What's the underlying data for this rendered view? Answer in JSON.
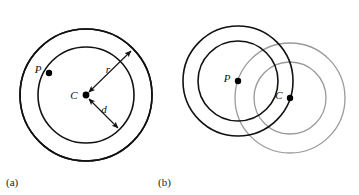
{
  "figure": {
    "background_color": "#ffffff",
    "width": 359,
    "height": 195,
    "stroke_dark": "#111111",
    "stroke_gray": "#9a9a9a",
    "dot_color": "#000000"
  },
  "panel_a": {
    "caption": "(a)",
    "caption_x": 6,
    "caption_y": 185,
    "center": {
      "label": "C",
      "x": 86,
      "y": 95,
      "label_x": 74,
      "label_y": 99
    },
    "point_p": {
      "label": "P",
      "x": 49,
      "y": 73,
      "label_x": 36,
      "label_y": 73
    },
    "circles": [
      {
        "name": "outer-circle",
        "cx": 86,
        "cy": 95,
        "r": 66,
        "stroke": "#111111",
        "stroke_width": 1.6
      },
      {
        "name": "inner-circle",
        "cx": 86,
        "cy": 95,
        "r": 48,
        "stroke": "#111111",
        "stroke_width": 1.6
      }
    ],
    "arrows": [
      {
        "name": "radius-r-arrow",
        "label": "r",
        "label_x": 107,
        "label_y": 72,
        "x1": 86,
        "y1": 95,
        "x2": 133,
        "y2": 49,
        "double_headed": true
      },
      {
        "name": "distance-d-arrow",
        "label": "d",
        "label_x": 103,
        "label_y": 112,
        "x1": 86,
        "y1": 95,
        "x2": 120,
        "y2": 129,
        "double_headed": true
      }
    ]
  },
  "panel_b": {
    "caption": "(b)",
    "caption_x": 158,
    "caption_y": 185,
    "point_p": {
      "label": "P",
      "x": 238,
      "y": 81,
      "label_x": 225,
      "label_y": 82
    },
    "point_c": {
      "label": "C",
      "x": 290,
      "y": 98,
      "label_x": 277,
      "label_y": 99
    },
    "circles": [
      {
        "name": "p-outer-circle",
        "cx": 238,
        "cy": 81,
        "r": 55,
        "stroke": "#111111",
        "stroke_width": 1.6
      },
      {
        "name": "p-inner-circle",
        "cx": 238,
        "cy": 81,
        "r": 40,
        "stroke": "#111111",
        "stroke_width": 1.6
      },
      {
        "name": "c-outer-circle",
        "cx": 290,
        "cy": 98,
        "r": 55,
        "stroke": "#9a9a9a",
        "stroke_width": 1.3
      },
      {
        "name": "c-inner-circle",
        "cx": 290,
        "cy": 98,
        "r": 36,
        "stroke": "#9a9a9a",
        "stroke_width": 1.3
      }
    ]
  }
}
